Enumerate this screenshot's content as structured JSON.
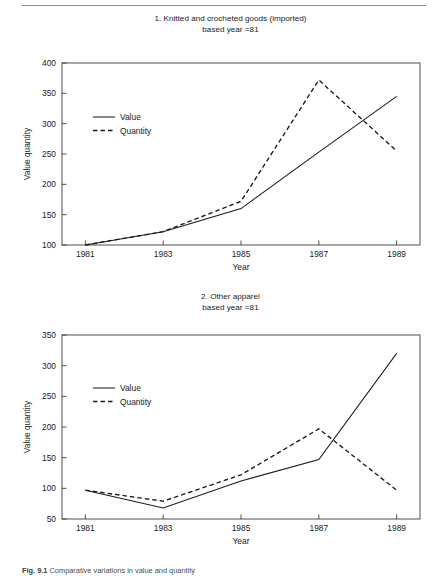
{
  "page": {
    "background_color": "#ffffff",
    "rule_color": "#8a8a8a",
    "line_color": "#1a1a1a",
    "axis_color": "#3c3c3c"
  },
  "caption": {
    "label": "Fig. 9.1",
    "text": "Comparative variations in value and quantity"
  },
  "charts": [
    {
      "id": "figure-1",
      "title_line1": "1. Knitted and crocheted goods (imported)",
      "title_line2": "based year =81",
      "xlabel": "Year",
      "ylabel": "Value quantity",
      "legend": [
        {
          "label": "Value",
          "style": "solid"
        },
        {
          "label": "Quantity",
          "style": "dashed"
        }
      ]
    },
    {
      "id": "figure-2",
      "title_line1": "2. Other apparel",
      "title_line2": "based year =81",
      "xlabel": "Year",
      "ylabel": "Value quantity",
      "legend": [
        {
          "label": "Value",
          "style": "solid"
        },
        {
          "label": "Quantity",
          "style": "dashed"
        }
      ]
    }
  ],
  "chart_data": [
    {
      "type": "line",
      "title": "1. Knitted and crocheted goods (imported) based year =81",
      "xlabel": "Year",
      "ylabel": "Value quantity",
      "x": [
        1981,
        1983,
        1985,
        1987,
        1989
      ],
      "xticklabels": [
        "1981",
        "1983",
        "1985",
        "1987",
        "1989"
      ],
      "yticks": [
        100,
        150,
        200,
        250,
        300,
        350,
        400
      ],
      "yticklabels": [
        "100",
        "150",
        "200",
        "250",
        "300",
        "350",
        "400"
      ],
      "xlim": [
        1980.4,
        1989.6
      ],
      "ylim": [
        100,
        400
      ],
      "grid": false,
      "legend_position": "upper-left-inside",
      "series": [
        {
          "name": "Value",
          "style": "solid",
          "values": [
            100,
            122,
            160,
            253,
            345
          ]
        },
        {
          "name": "Quantity",
          "style": "dashed",
          "values": [
            100,
            122,
            172,
            372,
            255
          ]
        }
      ]
    },
    {
      "type": "line",
      "title": "2. Other apparel based year =81",
      "xlabel": "Year",
      "ylabel": "Value quantity",
      "x": [
        1981,
        1983,
        1985,
        1987,
        1989
      ],
      "xticklabels": [
        "1981",
        "1983",
        "1985",
        "1987",
        "1989"
      ],
      "yticks": [
        50,
        100,
        150,
        200,
        250,
        300,
        350
      ],
      "yticklabels": [
        "50",
        "100",
        "150",
        "200",
        "250",
        "300",
        "350"
      ],
      "xlim": [
        1980.4,
        1989.6
      ],
      "ylim": [
        50,
        350
      ],
      "grid": false,
      "legend_position": "upper-left-inside",
      "series": [
        {
          "name": "Value",
          "style": "solid",
          "values": [
            97,
            68,
            112,
            147,
            320
          ]
        },
        {
          "name": "Quantity",
          "style": "dashed",
          "values": [
            97,
            79,
            122,
            197,
            97
          ]
        }
      ]
    }
  ]
}
